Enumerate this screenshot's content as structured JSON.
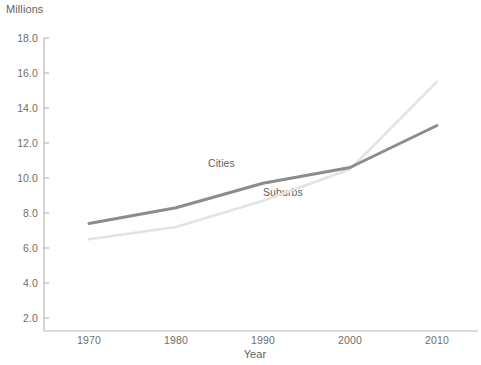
{
  "chart_data": {
    "type": "line",
    "title": "",
    "xlabel": "Year",
    "ylabel": "Millions",
    "x": [
      1970,
      1980,
      1990,
      2000,
      2010
    ],
    "xtick_labels": [
      "1970",
      "1980",
      "1990",
      "2000",
      "2010"
    ],
    "ytick_labels": [
      "2.0",
      "4.0",
      "6.0",
      "8.0",
      "10.0",
      "12.0",
      "14.0",
      "16.0",
      "18.0"
    ],
    "ytick_values": [
      2.0,
      4.0,
      6.0,
      8.0,
      10.0,
      12.0,
      14.0,
      16.0,
      18.0
    ],
    "ylim": [
      0,
      18.0
    ],
    "xlim": [
      1966,
      2012
    ],
    "grid": false,
    "legend_position": "inline-annotations",
    "series": [
      {
        "name": "Cities",
        "color": "#8c8c8c",
        "values": [
          7.4,
          8.3,
          9.7,
          10.6,
          13.0
        ],
        "label_text": "Cities"
      },
      {
        "name": "Suburbs",
        "color": "#e3e3e3",
        "values": [
          6.5,
          7.2,
          8.7,
          10.5,
          15.5
        ],
        "label_text": "Suburbs"
      }
    ]
  },
  "axes": {
    "unit_label": "Millions",
    "x_title": "Year"
  },
  "style": {
    "axis_color": "#b9b9b9",
    "text_color": "#6f6f6f",
    "background": "#ffffff"
  }
}
